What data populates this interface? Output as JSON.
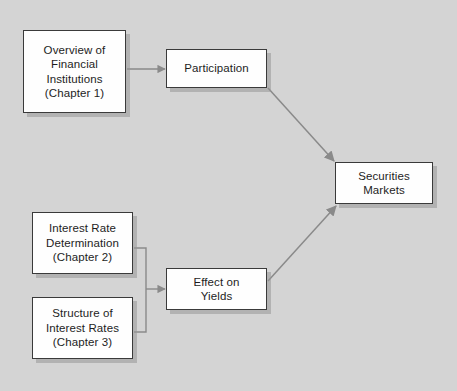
{
  "diagram": {
    "background_color": "#d4d4d4",
    "box_fill_color": "#fefefe",
    "box_border_color": "#3a3a3a",
    "connector_color": "#8a8a8a",
    "nodes": [
      {
        "id": "overview-financial-institutions",
        "label": "Overview of\nFinancial\nInstitutions\n(Chapter 1)",
        "x": 23,
        "y": 30,
        "width": 103,
        "height": 83
      },
      {
        "id": "participation",
        "label": "Participation",
        "x": 166,
        "y": 49,
        "width": 101,
        "height": 39
      },
      {
        "id": "interest-rate-determination",
        "label": "Interest Rate\nDetermination\n(Chapter 2)",
        "x": 32,
        "y": 212,
        "width": 101,
        "height": 62
      },
      {
        "id": "structure-of-interest-rates",
        "label": "Structure of\nInterest Rates\n(Chapter 3)",
        "x": 32,
        "y": 297,
        "width": 101,
        "height": 62
      },
      {
        "id": "effect-on-yields",
        "label": "Effect on\nYields",
        "x": 166,
        "y": 268,
        "width": 101,
        "height": 42
      },
      {
        "id": "securities-markets",
        "label": "Securities\nMarkets",
        "x": 335,
        "y": 162,
        "width": 98,
        "height": 42
      }
    ],
    "connectors": [
      {
        "id": "overview-to-participation",
        "from": "overview-financial-institutions",
        "to": "participation",
        "kind": "arrow-horizontal"
      },
      {
        "id": "participation-to-securities-markets",
        "from": "participation",
        "to": "securities-markets",
        "kind": "arrow-diagonal"
      },
      {
        "id": "rates-bracket-to-effect-on-yields",
        "from": "interest-rate-determination, structure-of-interest-rates",
        "to": "effect-on-yields",
        "kind": "bracket-arrow"
      },
      {
        "id": "effect-on-yields-to-securities-markets",
        "from": "effect-on-yields",
        "to": "securities-markets",
        "kind": "arrow-diagonal"
      }
    ]
  }
}
